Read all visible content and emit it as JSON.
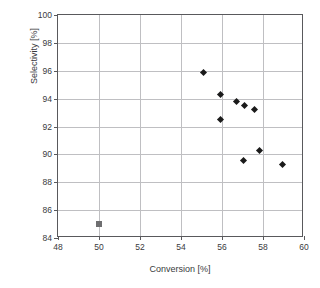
{
  "chart_data": {
    "type": "scatter",
    "title": "",
    "xlabel": "Conversion [%]",
    "ylabel": "Selectivity [%]",
    "xlim": [
      48,
      60
    ],
    "ylim": [
      84,
      100
    ],
    "xticks": [
      48,
      50,
      52,
      54,
      56,
      58,
      60
    ],
    "yticks": [
      84,
      86,
      88,
      90,
      92,
      94,
      96,
      98,
      100
    ],
    "xtick_labels": [
      "48",
      "50",
      "52",
      "54",
      "56",
      "58",
      "60"
    ],
    "ytick_labels": [
      "84",
      "86",
      "88",
      "90",
      "92",
      "94",
      "96",
      "98",
      "100"
    ],
    "grid": true,
    "legend": "none",
    "series": [
      {
        "name": "series-diamond",
        "marker": "diamond",
        "color": "#1a1a1a",
        "points": [
          {
            "x": 55.1,
            "y": 95.9
          },
          {
            "x": 55.95,
            "y": 94.3
          },
          {
            "x": 55.95,
            "y": 92.5
          },
          {
            "x": 56.7,
            "y": 93.8
          },
          {
            "x": 57.1,
            "y": 93.5
          },
          {
            "x": 57.6,
            "y": 93.25
          },
          {
            "x": 57.85,
            "y": 90.3
          },
          {
            "x": 57.05,
            "y": 89.55
          },
          {
            "x": 58.95,
            "y": 89.25
          }
        ]
      },
      {
        "name": "series-square",
        "marker": "square",
        "color": "#6e6e70",
        "points": [
          {
            "x": 50.0,
            "y": 85.0
          }
        ]
      }
    ]
  }
}
